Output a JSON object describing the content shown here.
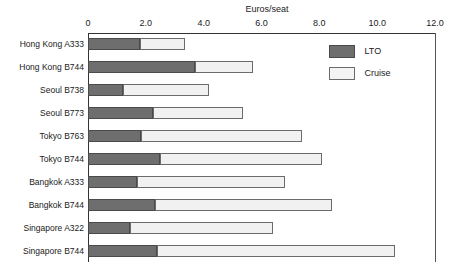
{
  "chart_data": {
    "type": "bar",
    "orientation": "horizontal",
    "stacked": true,
    "title": "",
    "xlabel": "Euros/seat",
    "ylabel": "",
    "xlim": [
      0,
      12
    ],
    "xticks": [
      "0",
      "2.0",
      "4.0",
      "6.0",
      "8.0",
      "10.0",
      "12.0"
    ],
    "xtick_values": [
      0,
      2,
      4,
      6,
      8,
      10,
      12
    ],
    "grid": false,
    "legend_position": "upper-right-inside",
    "categories": [
      "Hong Kong A333",
      "Hong Kong B744",
      "Seoul B738",
      "Seoul B773",
      "Tokyo B763",
      "Tokyo B744",
      "Bangkok A333",
      "Bangkok B744",
      "Singapore A322",
      "Singapore B744"
    ],
    "series": [
      {
        "name": "LTO",
        "color": "#6e6e6e",
        "values": [
          1.8,
          3.7,
          1.2,
          2.25,
          1.85,
          2.5,
          1.7,
          2.3,
          1.45,
          2.4
        ]
      },
      {
        "name": "Cruise",
        "color": "#f1f1f1",
        "values": [
          1.55,
          2.0,
          3.0,
          3.1,
          5.55,
          5.6,
          5.1,
          6.15,
          4.95,
          8.2
        ]
      }
    ],
    "totals": [
      3.35,
      5.7,
      4.2,
      5.35,
      7.4,
      8.1,
      6.8,
      8.45,
      6.4,
      10.6
    ]
  },
  "legend": {
    "items": [
      {
        "label": "LTO"
      },
      {
        "label": "Cruise"
      }
    ]
  }
}
